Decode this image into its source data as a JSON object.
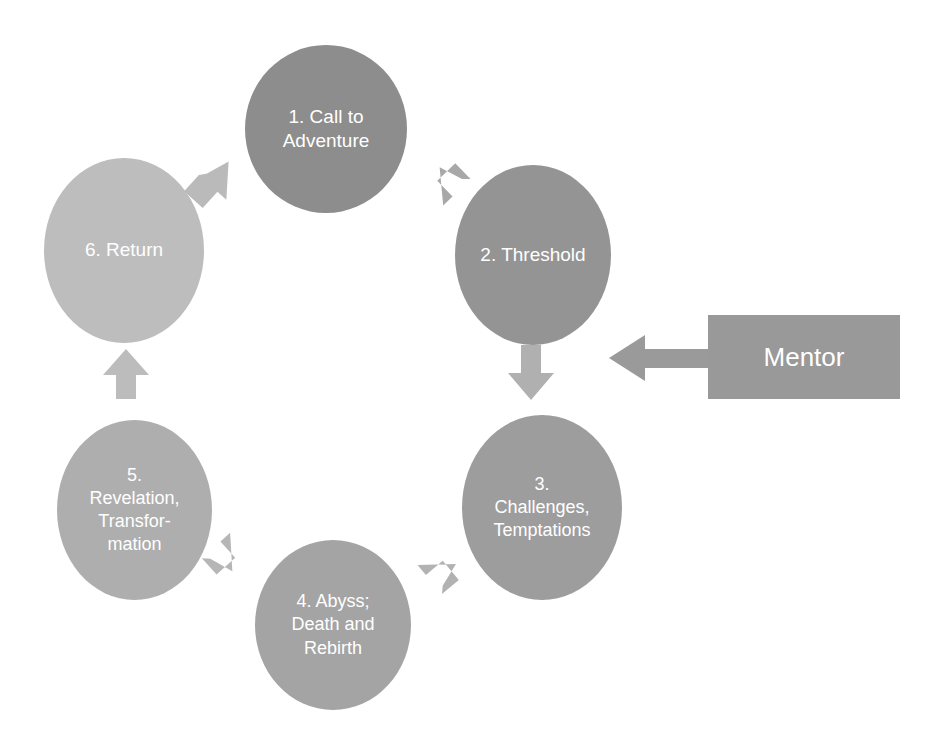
{
  "diagram": {
    "type": "cycle-diagram",
    "background_color": "#ffffff"
  },
  "nodes": [
    {
      "id": "node1",
      "number": "1",
      "label": "1. Call to\nAdventure",
      "color": "#8d8d8d",
      "text_color": "#ffffff"
    },
    {
      "id": "node2",
      "number": "2",
      "label": "2. Threshold",
      "color": "#949494",
      "text_color": "#ffffff"
    },
    {
      "id": "node3",
      "number": "3",
      "label": "3.\nChallenges,\nTemptations",
      "color": "#9d9d9d",
      "text_color": "#ffffff"
    },
    {
      "id": "node4",
      "number": "4",
      "label": "4. Abyss;\nDeath and\nRebirth",
      "color": "#a4a4a4",
      "text_color": "#ffffff"
    },
    {
      "id": "node5",
      "number": "5",
      "label": "5.\nRevelation,\nTransfor-\nmation",
      "color": "#aeaeae",
      "text_color": "#ffffff"
    },
    {
      "id": "node6",
      "number": "6",
      "label": "6. Return",
      "color": "#bdbdbd",
      "text_color": "#ffffff"
    }
  ],
  "mentor": {
    "label": "Mentor",
    "color": "#999999",
    "text_color": "#ffffff",
    "arrow_points_to": "2. Threshold"
  },
  "connectors": [
    {
      "name": "arrow-1-to-2",
      "from": "1. Call to Adventure",
      "to": "2. Threshold",
      "direction": "down-right",
      "color": "#a8a8a8"
    },
    {
      "name": "arrow-2-to-3",
      "from": "2. Threshold",
      "to": "3. Challenges, Temptations",
      "direction": "down",
      "color": "#b0b0b0"
    },
    {
      "name": "arrow-3-to-4",
      "from": "3. Challenges, Temptations",
      "to": "4. Abyss; Death and Rebirth",
      "direction": "down-left",
      "color": "#b2b2b2"
    },
    {
      "name": "arrow-4-to-5",
      "from": "4. Abyss; Death and Rebirth",
      "to": "5. Revelation, Transformation",
      "direction": "up-left",
      "color": "#b6b6b6"
    },
    {
      "name": "arrow-5-to-6",
      "from": "5. Revelation, Transformation",
      "to": "6. Return",
      "direction": "up",
      "color": "#bcbcbc"
    },
    {
      "name": "arrow-6-to-1",
      "from": "6. Return",
      "to": "1. Call to Adventure",
      "direction": "up-right",
      "color": "#bababa"
    },
    {
      "name": "arrow-mentor-to-2",
      "from": "Mentor",
      "to": "2. Threshold",
      "direction": "left",
      "color": "#9a9a9a"
    }
  ]
}
